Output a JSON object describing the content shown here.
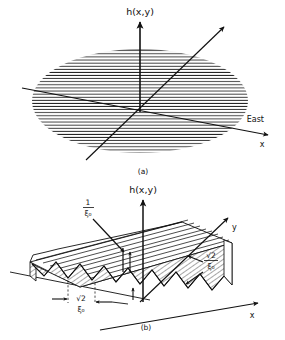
{
  "figure": {
    "type": "scientific-diagram",
    "ink_color": "#111111",
    "background_color": "#ffffff",
    "panels": [
      {
        "id": "a",
        "label": "(a)",
        "description": "Isotropic randomly rough surface shown as a hatched ellipse in the x-y plane with vertical height axis",
        "axes": [
          {
            "name": "height-axis",
            "label": "h(x,y)",
            "direction": "up"
          },
          {
            "name": "x-axis",
            "label": "x",
            "direction": "right-down",
            "annotation": "East"
          },
          {
            "name": "y-axis",
            "label": "",
            "direction": "up-right"
          }
        ],
        "annotations": [
          {
            "name": "east-label",
            "text": "East"
          }
        ],
        "hatching": "horizontal-lines"
      },
      {
        "id": "b",
        "label": "(b)",
        "description": "One-dimensional corrugated sawtooth surface slab with ridges parallel to the y axis",
        "axes": [
          {
            "name": "height-axis",
            "label": "h(x,y)",
            "direction": "up"
          },
          {
            "name": "x-axis",
            "label": "x",
            "direction": "right-down"
          },
          {
            "name": "y-axis",
            "label": "y",
            "direction": "up-right"
          }
        ],
        "annotations": [
          {
            "name": "ridge-height-label",
            "numerator": "1",
            "denominator": "ξ₀",
            "text": "1/ξ₀",
            "points_to": "ridge amplitude"
          },
          {
            "name": "slope-label",
            "numerator": "√2",
            "denominator": "ξ₀",
            "text": "√2/ξ₀",
            "points_to": "surface slope along y"
          },
          {
            "name": "period-label",
            "numerator": "√2",
            "denominator": "ξ₀",
            "text": "√2/ξ₀",
            "points_to": "corrugation period along x"
          }
        ],
        "hatching": "diagonal-lines"
      }
    ],
    "symbols": {
      "h_label": "h(x,y)",
      "x_label": "x",
      "y_label": "y",
      "east_label": "East",
      "panel_a_label": "(a)",
      "panel_b_label": "(b)",
      "one": "1",
      "sqrt2": "√2",
      "xi_zero": "ξ₀"
    }
  }
}
